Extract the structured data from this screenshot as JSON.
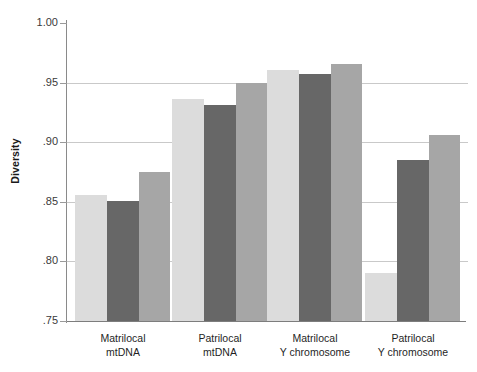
{
  "chart_data": {
    "type": "bar",
    "title": "",
    "subtitle": "",
    "xlabel": "",
    "ylabel": "Diversity",
    "ylim": [
      0.75,
      1.0
    ],
    "yticks": [
      1.0,
      0.95,
      0.9,
      0.85,
      0.8,
      0.75
    ],
    "ytick_labels": [
      "1.00",
      ".95",
      ".90",
      ".85",
      ".80",
      ".75"
    ],
    "grid": "horizontal",
    "legend": "none",
    "categories": [
      "Matrilocal mtDNA",
      "Patrilocal mtDNA",
      "Matrilocal Y chromosome",
      "Patrilocal Y chromosome"
    ],
    "category_lines": [
      [
        "Matrilocal",
        "mtDNA"
      ],
      [
        "Patrilocal",
        "mtDNA"
      ],
      [
        "Matrilocal",
        "Y chromosome"
      ],
      [
        "Patrilocal",
        "Y chromosome"
      ]
    ],
    "series": [
      {
        "name": "series-1",
        "color": "#dcdcdc",
        "values": [
          0.856,
          0.936,
          0.961,
          0.79
        ]
      },
      {
        "name": "series-2",
        "color": "#676767",
        "values": [
          0.851,
          0.931,
          0.957,
          0.885
        ]
      },
      {
        "name": "series-3",
        "color": "#a6a6a6",
        "values": [
          0.875,
          0.95,
          0.966,
          0.906
        ]
      }
    ],
    "colors": {
      "series_1": "#dcdcdc",
      "series_2": "#676767",
      "series_3": "#a6a6a6",
      "gridline": "#c9c9c9",
      "axis": "#8a8a8a",
      "text": "#1f1f1f",
      "background": "#ffffff"
    }
  }
}
